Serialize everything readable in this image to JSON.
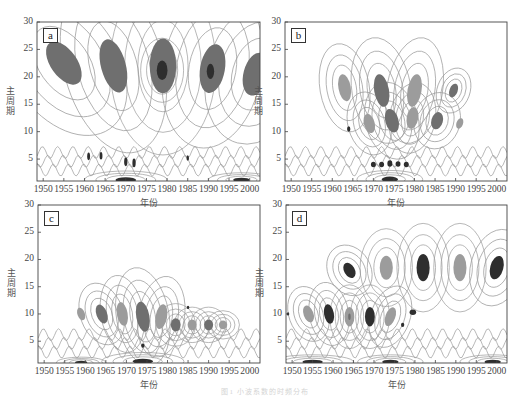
{
  "figure": {
    "caption": "图1   小波系数的时频分布",
    "colors": {
      "frame": "#444444",
      "contour": "#9a9a9a",
      "fill_light": "#9c9c9c",
      "fill_mid": "#6f6f6f",
      "fill_dark": "#2e2e2e"
    }
  },
  "chart_data": [
    {
      "type": "heatmap",
      "panel": "a",
      "title": "a",
      "xlabel": "年份",
      "ylabel": "主周期",
      "xlim": [
        1948.5,
        2002.5
      ],
      "ylim": [
        1,
        30
      ],
      "x_ticks": [
        "1950",
        "1955",
        "1960",
        "1965",
        "1970",
        "1975",
        "1980",
        "1985",
        "1990",
        "1995",
        "2000"
      ],
      "y_ticks": [
        "5",
        "10",
        "15",
        "20",
        "25",
        "30"
      ],
      "grid": false,
      "regions": [
        {
          "x": 1955,
          "y": 22.5,
          "rx": 3.2,
          "ry": 4.5,
          "rot": -35,
          "level": "mid"
        },
        {
          "x": 1967,
          "y": 22.0,
          "rx": 3.0,
          "ry": 5.0,
          "rot": -15,
          "level": "mid"
        },
        {
          "x": 1979,
          "y": 22.0,
          "rx": 3.2,
          "ry": 5.0,
          "rot": 0,
          "level": "mid"
        },
        {
          "x": 1978.8,
          "y": 21.2,
          "rx": 1.3,
          "ry": 1.8,
          "rot": 0,
          "level": "dark"
        },
        {
          "x": 1991,
          "y": 21.5,
          "rx": 3.0,
          "ry": 4.5,
          "rot": 10,
          "level": "mid"
        },
        {
          "x": 1990.5,
          "y": 21.0,
          "rx": 0.9,
          "ry": 1.4,
          "rot": 0,
          "level": "dark"
        },
        {
          "x": 2001.5,
          "y": 20.5,
          "rx": 3.0,
          "ry": 4.0,
          "rot": 15,
          "level": "mid"
        },
        {
          "x": 1961,
          "y": 5.5,
          "rx": 0.35,
          "ry": 0.7,
          "rot": 0,
          "level": "dark"
        },
        {
          "x": 1964,
          "y": 5.6,
          "rx": 0.35,
          "ry": 0.7,
          "rot": 0,
          "level": "dark"
        },
        {
          "x": 1970,
          "y": 4.5,
          "rx": 0.4,
          "ry": 0.8,
          "rot": 0,
          "level": "dark"
        },
        {
          "x": 1972,
          "y": 4.3,
          "rx": 0.4,
          "ry": 0.8,
          "rot": 0,
          "level": "dark"
        },
        {
          "x": 1985,
          "y": 5.2,
          "rx": 0.3,
          "ry": 0.5,
          "rot": 0,
          "level": "dark"
        },
        {
          "x": 1970,
          "y": 1.2,
          "rx": 2.5,
          "ry": 0.5,
          "rot": 0,
          "level": "dark"
        },
        {
          "x": 1998,
          "y": 1.2,
          "rx": 2.0,
          "ry": 0.4,
          "rot": 0,
          "level": "dark"
        }
      ]
    },
    {
      "type": "heatmap",
      "panel": "b",
      "title": "b",
      "xlabel": "年份",
      "ylabel": "主周期",
      "xlim": [
        1948.5,
        2002.5
      ],
      "ylim": [
        1,
        30
      ],
      "x_ticks": [
        "1950",
        "1955",
        "1960",
        "1965",
        "1970",
        "1975",
        "1980",
        "1985",
        "1990",
        "1995",
        "2000"
      ],
      "y_ticks": [
        "5",
        "10",
        "15",
        "20",
        "25",
        "30"
      ],
      "grid": false,
      "regions": [
        {
          "x": 1963,
          "y": 18.0,
          "rx": 1.5,
          "ry": 2.5,
          "rot": -10,
          "level": "light"
        },
        {
          "x": 1964,
          "y": 10.5,
          "rx": 0.4,
          "ry": 0.5,
          "rot": 0,
          "level": "dark"
        },
        {
          "x": 1969,
          "y": 11.5,
          "rx": 1.3,
          "ry": 1.8,
          "rot": -15,
          "level": "light"
        },
        {
          "x": 1972,
          "y": 17.5,
          "rx": 1.8,
          "ry": 3.0,
          "rot": -10,
          "level": "mid"
        },
        {
          "x": 1974.5,
          "y": 12.0,
          "rx": 1.6,
          "ry": 2.2,
          "rot": -15,
          "level": "mid"
        },
        {
          "x": 1980,
          "y": 17.5,
          "rx": 1.7,
          "ry": 3.0,
          "rot": 10,
          "level": "light"
        },
        {
          "x": 1979.5,
          "y": 12.5,
          "rx": 1.4,
          "ry": 2.0,
          "rot": 10,
          "level": "light"
        },
        {
          "x": 1985.5,
          "y": 12.0,
          "rx": 1.4,
          "ry": 1.6,
          "rot": 15,
          "level": "mid"
        },
        {
          "x": 1989.5,
          "y": 17.5,
          "rx": 1.0,
          "ry": 1.3,
          "rot": 20,
          "level": "mid"
        },
        {
          "x": 1991,
          "y": 11.5,
          "rx": 0.8,
          "ry": 1.0,
          "rot": 20,
          "level": "light"
        },
        {
          "x": 1970,
          "y": 4.0,
          "rx": 0.6,
          "ry": 0.5,
          "rot": 0,
          "level": "dark"
        },
        {
          "x": 1972,
          "y": 4.0,
          "rx": 0.6,
          "ry": 0.5,
          "rot": 0,
          "level": "dark"
        },
        {
          "x": 1974,
          "y": 4.2,
          "rx": 0.6,
          "ry": 0.6,
          "rot": 0,
          "level": "dark"
        },
        {
          "x": 1976,
          "y": 4.1,
          "rx": 0.6,
          "ry": 0.5,
          "rot": 0,
          "level": "dark"
        },
        {
          "x": 1978,
          "y": 4.0,
          "rx": 0.6,
          "ry": 0.5,
          "rot": 0,
          "level": "dark"
        },
        {
          "x": 1974,
          "y": 1.3,
          "rx": 2.0,
          "ry": 0.5,
          "rot": 0,
          "level": "dark"
        }
      ]
    },
    {
      "type": "heatmap",
      "panel": "c",
      "title": "c",
      "xlabel": "年份",
      "ylabel": "主周期",
      "xlim": [
        1948.5,
        2002.5
      ],
      "ylim": [
        1,
        30
      ],
      "x_ticks": [
        "1950",
        "1955",
        "1960",
        "1965",
        "1970",
        "1975",
        "1980",
        "1985",
        "1990",
        "1995",
        "2000"
      ],
      "y_ticks": [
        "5",
        "10",
        "15",
        "20",
        "25",
        "30"
      ],
      "grid": false,
      "regions": [
        {
          "x": 1959,
          "y": 10.0,
          "rx": 0.9,
          "ry": 1.2,
          "rot": -20,
          "level": "light"
        },
        {
          "x": 1964,
          "y": 10.0,
          "rx": 1.3,
          "ry": 1.8,
          "rot": -20,
          "level": "mid"
        },
        {
          "x": 1969,
          "y": 10.0,
          "rx": 1.3,
          "ry": 2.2,
          "rot": -10,
          "level": "light"
        },
        {
          "x": 1974,
          "y": 9.5,
          "rx": 1.6,
          "ry": 2.8,
          "rot": -10,
          "level": "mid"
        },
        {
          "x": 1978.5,
          "y": 9.5,
          "rx": 1.4,
          "ry": 2.3,
          "rot": 10,
          "level": "light"
        },
        {
          "x": 1982,
          "y": 8.0,
          "rx": 1.2,
          "ry": 1.2,
          "rot": 0,
          "level": "mid"
        },
        {
          "x": 1986,
          "y": 8.0,
          "rx": 1.1,
          "ry": 1.0,
          "rot": 0,
          "level": "light"
        },
        {
          "x": 1990,
          "y": 8.0,
          "rx": 1.1,
          "ry": 1.0,
          "rot": 0,
          "level": "mid"
        },
        {
          "x": 1993.5,
          "y": 8.0,
          "rx": 1.0,
          "ry": 0.8,
          "rot": 0,
          "level": "light"
        },
        {
          "x": 1985,
          "y": 11.2,
          "rx": 0.3,
          "ry": 0.3,
          "rot": 0,
          "level": "dark"
        },
        {
          "x": 1974,
          "y": 4.2,
          "rx": 0.4,
          "ry": 0.4,
          "rot": 0,
          "level": "dark"
        },
        {
          "x": 1974,
          "y": 1.3,
          "rx": 2.5,
          "ry": 0.5,
          "rot": 0,
          "level": "dark"
        },
        {
          "x": 1959,
          "y": 1.1,
          "rx": 1.5,
          "ry": 0.3,
          "rot": 0,
          "level": "dark"
        }
      ]
    },
    {
      "type": "heatmap",
      "panel": "d",
      "title": "d",
      "xlabel": "年份",
      "ylabel": "主周期",
      "xlim": [
        1948.5,
        2002.5
      ],
      "ylim": [
        1,
        30
      ],
      "x_ticks": [
        "1950",
        "1955",
        "1960",
        "1965",
        "1970",
        "1975",
        "1980",
        "1985",
        "1990",
        "1995",
        "2000"
      ],
      "y_ticks": [
        "5",
        "10",
        "15",
        "20",
        "25",
        "30"
      ],
      "grid": false,
      "regions": [
        {
          "x": 1964,
          "y": 18.0,
          "rx": 1.3,
          "ry": 1.5,
          "rot": -30,
          "level": "dark"
        },
        {
          "x": 1973,
          "y": 18.5,
          "rx": 1.6,
          "ry": 2.2,
          "rot": 0,
          "level": "light"
        },
        {
          "x": 1982,
          "y": 18.5,
          "rx": 1.6,
          "ry": 2.5,
          "rot": 0,
          "level": "dark"
        },
        {
          "x": 1991,
          "y": 18.5,
          "rx": 1.6,
          "ry": 2.5,
          "rot": 0,
          "level": "light"
        },
        {
          "x": 2000,
          "y": 18.5,
          "rx": 1.6,
          "ry": 2.2,
          "rot": 15,
          "level": "dark"
        },
        {
          "x": 1954,
          "y": 10.0,
          "rx": 1.2,
          "ry": 1.6,
          "rot": -20,
          "level": "light"
        },
        {
          "x": 1959,
          "y": 10.0,
          "rx": 1.2,
          "ry": 1.8,
          "rot": -10,
          "level": "dark"
        },
        {
          "x": 1964,
          "y": 9.5,
          "rx": 1.2,
          "ry": 1.8,
          "rot": 0,
          "level": "light"
        },
        {
          "x": 1964,
          "y": 9.5,
          "rx": 0.3,
          "ry": 0.6,
          "rot": 0,
          "level": "mid"
        },
        {
          "x": 1969,
          "y": 9.5,
          "rx": 1.2,
          "ry": 1.8,
          "rot": 0,
          "level": "dark"
        },
        {
          "x": 1974,
          "y": 9.5,
          "rx": 1.2,
          "ry": 1.8,
          "rot": 20,
          "level": "light"
        },
        {
          "x": 1979.5,
          "y": 10.3,
          "rx": 0.8,
          "ry": 0.5,
          "rot": 0,
          "level": "dark"
        },
        {
          "x": 1977,
          "y": 8.0,
          "rx": 0.4,
          "ry": 0.4,
          "rot": 0,
          "level": "dark"
        },
        {
          "x": 1949,
          "y": 10.0,
          "rx": 0.3,
          "ry": 0.3,
          "rot": 0,
          "level": "dark"
        },
        {
          "x": 1955,
          "y": 1.2,
          "rx": 2.5,
          "ry": 0.4,
          "rot": 0,
          "level": "dark"
        },
        {
          "x": 1974,
          "y": 1.2,
          "rx": 2.0,
          "ry": 0.4,
          "rot": 0,
          "level": "dark"
        },
        {
          "x": 1999,
          "y": 1.2,
          "rx": 2.0,
          "ry": 0.4,
          "rot": 0,
          "level": "dark"
        }
      ]
    }
  ]
}
